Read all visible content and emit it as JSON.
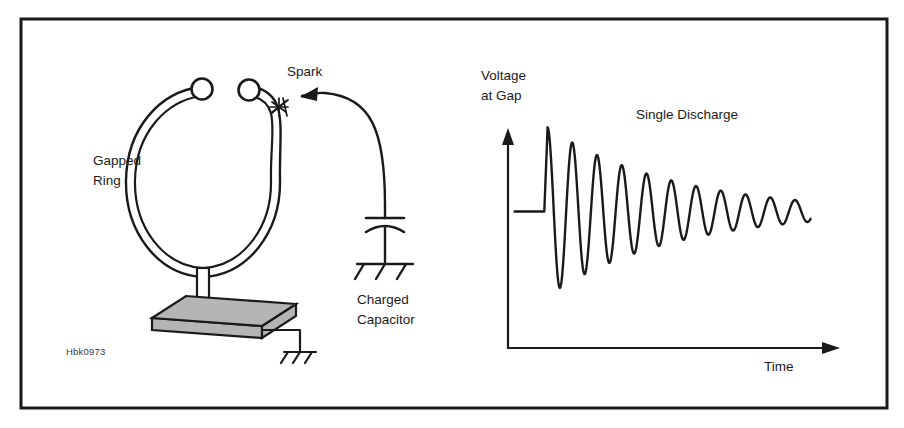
{
  "figure": {
    "id_code": "Hbk0973",
    "frame": {
      "stroke_color": "#1a1a1a",
      "x": 21,
      "y": 19,
      "width": 866,
      "height": 389
    },
    "background_color": "#ffffff",
    "ink_color": "#1a1a1a",
    "base_plate_color": "#b5b5b5"
  },
  "apparatus": {
    "ring_label_line1": "Gapped",
    "ring_label_line2": "Ring",
    "spark_label": "Spark",
    "capacitor_label_line1": "Charged",
    "capacitor_label_line2": "Capacitor",
    "icons": {
      "spark": "spark-burst-icon",
      "capacitor": "capacitor-icon",
      "ground_capacitor": "ground-symbol-icon",
      "ground_base": "ground-symbol-icon",
      "ring": "gapped-ring-icon",
      "terminal_left": "ring-terminal-ball-icon",
      "terminal_right": "ring-terminal-ball-icon",
      "base_plate": "base-plate-icon",
      "support_post": "support-post-icon",
      "discharge_wire": "discharge-wire-arrow-icon"
    }
  },
  "plot": {
    "y_axis_label_line1": "Voltage",
    "y_axis_label_line2": "at Gap",
    "x_axis_label": "Time",
    "annotation": "Single Discharge"
  },
  "chart_data": {
    "type": "line",
    "title": "Single Discharge",
    "xlabel": "Time",
    "ylabel": "Voltage at Gap",
    "grid": false,
    "legend": null,
    "axis_arrows": {
      "x": true,
      "y": true
    },
    "xlim": [
      0,
      100
    ],
    "ylim": [
      -100,
      100
    ],
    "series": [
      {
        "name": "Gap voltage",
        "model": "damped-sinusoid-with-leading-step",
        "baseline_level": 18,
        "pre_breakdown_hold_x": [
          2,
          11
        ],
        "breakdown_peak": {
          "x": 12,
          "y": 96
        },
        "decay_constant": 0.0265,
        "period": 7.5,
        "peaks_x": [
          12,
          20.5,
          28,
          35.5,
          43,
          50.5,
          58,
          65.5,
          73,
          80.5,
          88
        ],
        "peaks_y": [
          96,
          72,
          60,
          51,
          43,
          36,
          31,
          26,
          22,
          19,
          16
        ],
        "troughs_x": [
          16,
          24,
          31.5,
          39,
          46.5,
          54,
          61.5,
          69,
          76.5,
          84
        ],
        "troughs_y": [
          -78,
          -50,
          -38,
          -30,
          -24,
          -20,
          -16,
          -13,
          -11,
          -9
        ]
      }
    ]
  }
}
